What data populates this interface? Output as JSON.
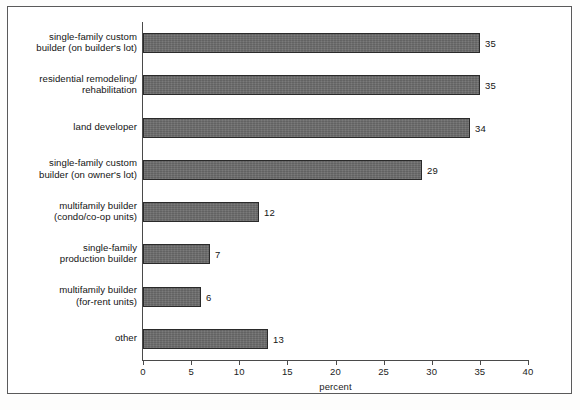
{
  "chart_data": {
    "type": "bar",
    "orientation": "horizontal",
    "title": "",
    "subtitle": "",
    "xlabel": "percent",
    "ylabel": "",
    "xlim": [
      0,
      40
    ],
    "xticks": [
      "0",
      "5",
      "10",
      "15",
      "20",
      "25",
      "30",
      "35",
      "40"
    ],
    "xtick_values": [
      0,
      5,
      10,
      15,
      20,
      25,
      30,
      35,
      40
    ],
    "grid": false,
    "legend": null,
    "categories": [
      "single-family custom\nbuilder (on builder's lot)",
      "residential remodeling/\nrehabilitation",
      "land developer",
      "single-family custom\nbuilder (on owner's lot)",
      "multifamily builder\n(condo/co-op units)",
      "single-family\nproduction builder",
      "multifamily builder\n(for-rent units)",
      "other"
    ],
    "values": [
      35,
      35,
      34,
      29,
      12,
      7,
      6,
      13
    ],
    "value_labels": [
      "35",
      "35",
      "34",
      "29",
      "12",
      "7",
      "6",
      "13"
    ],
    "bar_fill_color": "#6c6c6c",
    "bar_edge_color": "#2a2a2a",
    "axis_color": "#4a4a4a",
    "text_color": "#141414",
    "background_color": "#ffffff",
    "frame_color": "#5a5a5a"
  }
}
